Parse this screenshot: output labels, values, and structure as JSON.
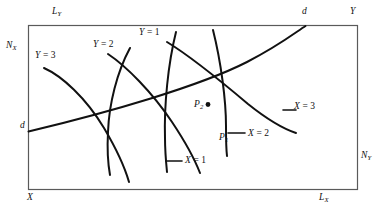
{
  "figure": {
    "type": "edgeworth-box-diagram",
    "background_color": "#ffffff",
    "line_color": "#111111",
    "box": {
      "border_color": "#5a5a5a",
      "x": 28,
      "y": 25,
      "width": 330,
      "height": 165
    },
    "corner_labels": {
      "top_left_origin": "X",
      "top_right_origin": "Y"
    },
    "axis_labels": [
      {
        "name": "L-sub-Y",
        "text": "L",
        "sub": "Y",
        "x": 52,
        "y": 8
      },
      {
        "name": "N-sub-X",
        "text": "N",
        "sub": "X",
        "x": 6,
        "y": 42
      },
      {
        "name": "X-origin",
        "text": "X",
        "sub": "",
        "x": 27,
        "y": 194
      },
      {
        "name": "Y-origin",
        "text": "Y",
        "sub": "",
        "x": 350,
        "y": 8
      },
      {
        "name": "L-sub-X",
        "text": "L",
        "sub": "X",
        "x": 319,
        "y": 194
      },
      {
        "name": "N-sub-Y",
        "text": "N",
        "sub": "Y",
        "x": 361,
        "y": 152
      }
    ],
    "contract_curve": {
      "name": "contract-curve-dd",
      "left_label": "d",
      "right_label": "d",
      "left_label_pos": {
        "x": 20,
        "y": 122
      },
      "right_label_pos": {
        "x": 302,
        "y": 8
      }
    },
    "isoquants_y": [
      {
        "label": "Y",
        "eq": "=",
        "value": "3",
        "x": 35,
        "y": 52
      },
      {
        "label": "Y",
        "eq": "=",
        "value": "2",
        "x": 93,
        "y": 41
      },
      {
        "label": "Y",
        "eq": "=",
        "value": "1",
        "x": 139,
        "y": 29
      }
    ],
    "isoquants_x": [
      {
        "label": "X",
        "eq": "=",
        "value": "1",
        "x": 185,
        "y": 157
      },
      {
        "label": "X",
        "eq": "=",
        "value": "2",
        "x": 248,
        "y": 130
      },
      {
        "label": "X",
        "eq": "=",
        "value": "3",
        "x": 294,
        "y": 103
      }
    ],
    "points": [
      {
        "label": "P",
        "sub": "2",
        "x": 194,
        "y": 101,
        "has_dot": true,
        "dot_x": 208,
        "dot_y": 105
      },
      {
        "label": "P",
        "sub": "1",
        "x": 219,
        "y": 134,
        "has_dot": false
      }
    ]
  }
}
